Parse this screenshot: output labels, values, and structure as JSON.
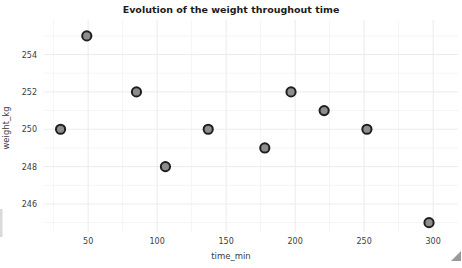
{
  "window": {
    "background": "#ffffff"
  },
  "chart_data": {
    "type": "scatter",
    "title": "Evolution of the weight throughout time",
    "xlabel": "time_min",
    "ylabel": "weight_kg",
    "x": [
      30,
      49,
      85,
      106,
      137,
      178,
      197,
      221,
      252,
      297
    ],
    "y": [
      250,
      255,
      252,
      248,
      250,
      249,
      252,
      251,
      250,
      245
    ],
    "xticks": [
      50,
      100,
      150,
      200,
      250,
      300
    ],
    "yticks": [
      246,
      248,
      250,
      252,
      254
    ],
    "xlim": [
      18,
      318
    ],
    "ylim": [
      244.5,
      255.85
    ],
    "grid": "on",
    "legend": "none",
    "colors": {
      "point_fill": "#8d8d8d",
      "point_stroke": "#1e1e1e",
      "grid_major": "#eeeaea",
      "grid_minor": "#f7f4f4",
      "tick_text": "#3d3d3d",
      "title_text": "#1c1c1c",
      "grip": "#9a9a9a",
      "edge_artifact": "#dadada"
    }
  }
}
